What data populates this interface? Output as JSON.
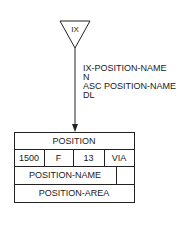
{
  "index_symbol": {
    "label": "IX",
    "shape": "inverted-triangle"
  },
  "annotation": {
    "lines": [
      "IX-POSITION-NAME",
      "N",
      "ASC POSITION-NAME",
      "DL"
    ]
  },
  "record": {
    "name": "POSITION",
    "attributes": [
      "1500",
      "F",
      "13",
      "VIA"
    ],
    "fields": [
      "POSITION-NAME",
      "POSITION-AREA"
    ]
  }
}
